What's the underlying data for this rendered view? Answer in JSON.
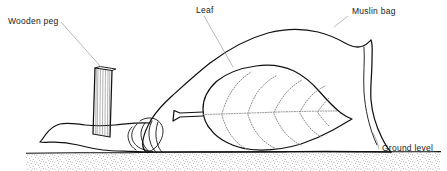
{
  "figure": {
    "type": "line-diagram",
    "line_color": "#111111",
    "leader_color": "#9a9a9a",
    "vein_color": "#8d8d8d",
    "background": "#ffffff"
  },
  "labels": {
    "wooden_peg": "Wooden peg",
    "leaf": "Leaf",
    "muslin_bag": "Muslin bag",
    "ground_level": "Ground level"
  },
  "parts": {
    "peg": "wooden-peg",
    "bag": "muslin-bag",
    "leaf": "leaf",
    "leaf_stalk": "leaf-stalk",
    "bag_neck": "bag-gathered-neck",
    "ground": "ground-soil",
    "bag_flap": "bag-fold-flap"
  }
}
